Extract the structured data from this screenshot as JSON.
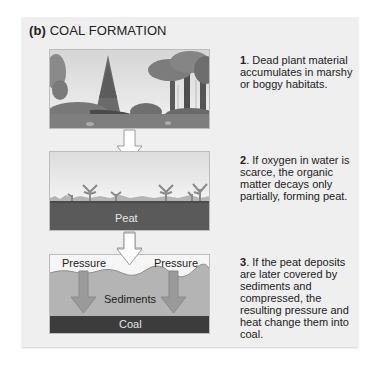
{
  "figure": {
    "title_prefix": "(b)",
    "title_text": "COAL FORMATION"
  },
  "steps": [
    {
      "number": "1",
      "text": ". Dead plant material accumulates in marshy or boggy habitats.",
      "image": "forest-swamp-illustration"
    },
    {
      "number": "2",
      "text": ". If oxygen in water is scarce, the organic matter decays only partially, forming peat.",
      "image": "peat-layer-illustration",
      "labels": {
        "peat": "Peat"
      }
    },
    {
      "number": "3",
      "text": ". If the peat deposits are later covered by sediments and compressed, the resulting pressure and heat change them into coal.",
      "image": "sediment-coal-illustration",
      "labels": {
        "pressure_left": "Pressure",
        "pressure_right": "Pressure",
        "sediments": "Sediments",
        "coal": "Coal"
      }
    }
  ],
  "colors": {
    "panel_bg": "#efefef",
    "peat": "#5a5a5a",
    "coal": "#3c3c3c",
    "sediments": "#b4b4b4",
    "arrow_fill": "#ffffff",
    "pressure_arrow": "#9a9a9a"
  }
}
